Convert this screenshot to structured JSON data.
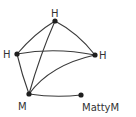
{
  "diagram": {
    "type": "graph",
    "nodes": [
      {
        "id": "top-h",
        "label": "H"
      },
      {
        "id": "left-h",
        "label": "H"
      },
      {
        "id": "right-h",
        "label": "H"
      },
      {
        "id": "m",
        "label": "M"
      },
      {
        "id": "mattym",
        "label": "MattyM"
      }
    ],
    "edges": [
      [
        "top-h",
        "left-h"
      ],
      [
        "top-h",
        "right-h"
      ],
      [
        "top-h",
        "m"
      ],
      [
        "left-h",
        "right-h"
      ],
      [
        "left-h",
        "m"
      ],
      [
        "right-h",
        "m"
      ],
      [
        "m",
        "mattym"
      ]
    ],
    "colors": {
      "stroke": "#3a3a3a",
      "node": "#1e1e1e",
      "background": "#ffffff"
    }
  }
}
